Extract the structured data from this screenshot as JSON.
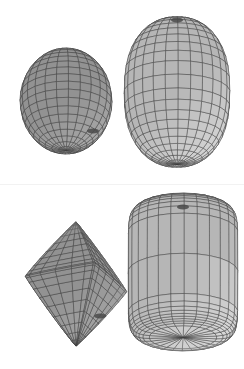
{
  "figure": {
    "title": "",
    "background_color": "#ffffff",
    "width": 244,
    "height": 369,
    "panel_count": 2,
    "divider_color": "#f2f2f2"
  },
  "style": {
    "mesh_line_color": "#3c3c3c",
    "mesh_line_color_light": "#5a5a5a",
    "face_light": "#c8c8c8",
    "face_mid": "#a8a8a8",
    "face_dark": "#858585",
    "face_darker": "#6e6e6e",
    "pole_color": "#4a4a4a",
    "line_width": 0.45
  },
  "chart_data": {
    "type": "scatter",
    "xlabel": "",
    "ylabel": "",
    "panels": [
      {
        "name": "top-panel",
        "index": 0,
        "shapes": [
          {
            "name": "sphere-left",
            "label": "sphere",
            "surface": "superellipsoid",
            "epsilon1": 1.0,
            "epsilon2": 1.0,
            "center": [
              66,
              101
            ],
            "radius_x": 46,
            "radius_y": 53,
            "u_divisions": 24,
            "v_divisions": 20,
            "yaw_deg": -18,
            "pitch_deg": 22,
            "shade": "dark",
            "pole_visible": true,
            "pole_position": [
              93,
              131
            ]
          },
          {
            "name": "egg-right",
            "label": "prolate ellipsoid",
            "surface": "superellipsoid",
            "epsilon1": 0.85,
            "epsilon2": 1.0,
            "center": [
              177,
              92
            ],
            "radius_x": 53,
            "radius_y": 74,
            "u_divisions": 26,
            "v_divisions": 22,
            "yaw_deg": -8,
            "pitch_deg": 14,
            "shade": "light",
            "pole_visible": true,
            "pole_position": [
              177,
              20
            ]
          }
        ]
      },
      {
        "name": "bottom-panel",
        "index": 1,
        "shapes": [
          {
            "name": "lobed-left",
            "label": "self-intersecting superellipsoid",
            "surface": "superellipsoid",
            "epsilon1": 1.9,
            "epsilon2": 1.9,
            "center": [
              76,
              284
            ],
            "radius_x": 54,
            "radius_y": 66,
            "u_divisions": 26,
            "v_divisions": 22,
            "yaw_deg": -20,
            "pitch_deg": 20,
            "shade": "dark",
            "pole_visible": true,
            "pole_position": [
              100,
              316
            ]
          },
          {
            "name": "barrel-right",
            "label": "cylindrical superellipsoid",
            "surface": "superellipsoid",
            "epsilon1": 0.25,
            "epsilon2": 1.0,
            "center": [
              183,
              272
            ],
            "radius_x": 55,
            "radius_y": 68,
            "u_divisions": 26,
            "v_divisions": 22,
            "yaw_deg": -8,
            "pitch_deg": 16,
            "shade": "light",
            "pole_visible": true,
            "pole_position": [
              183,
              207
            ]
          }
        ]
      }
    ]
  }
}
